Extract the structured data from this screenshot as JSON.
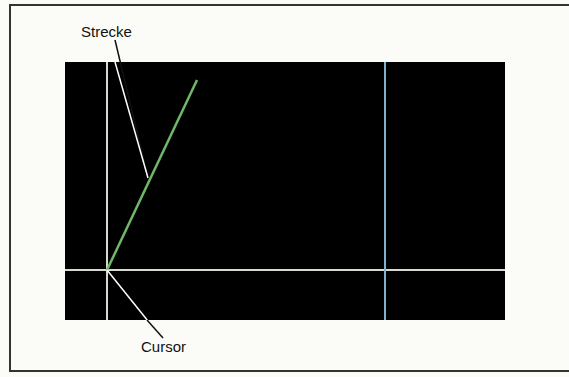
{
  "labels": {
    "strecke": "Strecke",
    "cursor": "Cursor"
  },
  "colors": {
    "screen": "#000000",
    "line_segment": "#6fb86a",
    "crosshair": "#d8d8d0",
    "marker_line": "#7fb0d0",
    "leader": "#111111"
  },
  "screen": {
    "x": 65,
    "y": 62,
    "width": 440,
    "height": 258
  },
  "crosshair": {
    "x": 107,
    "y": 270
  },
  "segment": {
    "x1": 107,
    "y1": 270,
    "x2": 197,
    "y2": 80
  },
  "marker_x": 385
}
